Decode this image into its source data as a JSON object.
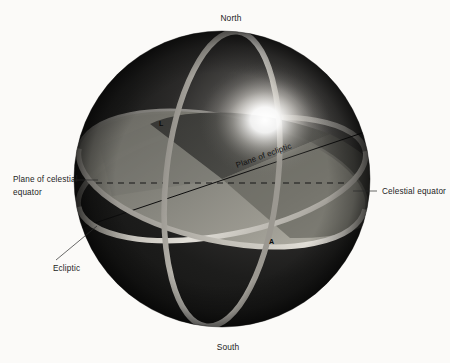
{
  "figure": {
    "background_color": "#fbfaf8"
  },
  "sphere": {
    "center_x": 222,
    "center_y": 179,
    "radius": 148,
    "fill_dark": "#141414",
    "fill_mid": "#262626",
    "highlight_color": "#ffffff",
    "highlight_x": 265,
    "highlight_y": 120
  },
  "rings": {
    "color": "#cfcbc2",
    "meridian_name": "meridian-ring",
    "equator_name": "celestial-equator-ring",
    "ecliptic_name": "ecliptic-ring"
  },
  "planes": {
    "ecliptic_plane_color": "#7d7d78",
    "ecliptic_wedge_color": "#3c3c3a",
    "dashed_line_color": "#1a1a1a",
    "diagonal_line_color": "#111111"
  },
  "labels": {
    "north": "North",
    "south": "South",
    "plane_of_celestial_equator_line1": "Plane of celestial",
    "plane_of_celestial_equator_line2": "equator",
    "celestial_equator": "Celestial equator",
    "ecliptic": "Ecliptic",
    "plane_of_ecliptic": "Plane of ecliptic"
  },
  "markers": {
    "upper_left": "L",
    "lower_right": "A"
  }
}
